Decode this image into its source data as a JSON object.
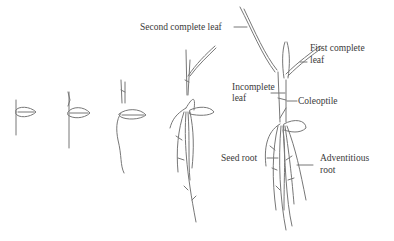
{
  "colors": {
    "line": "#777777",
    "text": "#3a3a3a",
    "background": "#ffffff"
  },
  "labels": {
    "second_complete_leaf": "Second complete leaf",
    "first_complete_leaf_1": "First complete",
    "first_complete_leaf_2": "leaf",
    "incomplete_leaf_1": "Incomplete",
    "incomplete_leaf_2": "leaf",
    "coleoptile": "Coleoptile",
    "seed_root": "Seed root",
    "adventitious_root_1": "Adventitious",
    "adventitious_root_2": "root"
  },
  "stages": [
    {
      "id": 1,
      "description": "germinating seed with emerging coleoptile and radicle"
    },
    {
      "id": 2,
      "description": "coleoptile elongated, seed root growing"
    },
    {
      "id": 3,
      "description": "incomplete leaf emerging, longer seed root"
    },
    {
      "id": 4,
      "description": "first complete leaf, adventitious roots developing"
    },
    {
      "id": 5,
      "description": "second complete leaf, full root system"
    }
  ]
}
